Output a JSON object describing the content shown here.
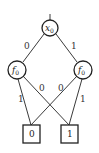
{
  "diagram": {
    "type": "binary-decision-diagram",
    "root": {
      "var": "x",
      "sub": "0"
    },
    "nodes": [
      {
        "id": "left",
        "var": "f",
        "sub": "0"
      },
      {
        "id": "right",
        "var": "f",
        "sub": "0"
      }
    ],
    "terminals": [
      {
        "id": "t0",
        "label": "0"
      },
      {
        "id": "t1",
        "label": "1"
      }
    ],
    "edges": [
      {
        "from": "root",
        "to": "left",
        "label": "0"
      },
      {
        "from": "root",
        "to": "right",
        "label": "1"
      },
      {
        "from": "left",
        "to": "t0",
        "label": "1"
      },
      {
        "from": "left",
        "to": "t1",
        "label": "0"
      },
      {
        "from": "right",
        "to": "t0",
        "label": "0"
      },
      {
        "from": "right",
        "to": "t1",
        "label": "1"
      }
    ]
  }
}
